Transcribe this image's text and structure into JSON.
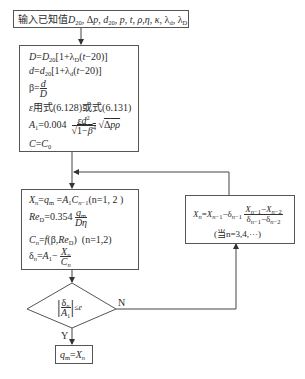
{
  "diagram": {
    "type": "flowchart",
    "input_box": {
      "prefix": "输入已知值",
      "variables": [
        "D20",
        "Δp",
        "d20",
        "p",
        "t",
        "ρ",
        "η",
        "κ",
        "λd",
        "λD"
      ]
    },
    "init_box": {
      "lines": [
        {
          "text": "D=D20[1+λD(t−20)]"
        },
        {
          "text": "d=d20[1+λd(t−20)]"
        },
        {
          "text": "β=d/D"
        },
        {
          "text": "ε用式(6.128)或式(6.131)"
        },
        {
          "text": "A1=0.004 εd²/√(1−β⁴) √(Δpρ)"
        },
        {
          "text": "C=C0"
        }
      ],
      "eps_rule": "ε用式(6.128)或式(6.131)",
      "a1_coef": "0.004"
    },
    "iter_box": {
      "lines": [
        {
          "text": "Xn=qm=A1Cn−1(n=1,2)"
        },
        {
          "text": "ReD=0.354 qm/(Dη)"
        },
        {
          "text": "Cn=f(β,ReD) (n=1,2)"
        },
        {
          "text": "δn=A1−Xn/Cn"
        }
      ],
      "n_range": "(n=1, 2 )",
      "n_range2": "(n=1,2)",
      "re_coef": "0.354"
    },
    "decision": {
      "condition": "|δn/A1| ≤ e",
      "le": "≤e",
      "yes_label": "Y",
      "no_label": "N"
    },
    "result_box": {
      "text": "qm=Xn"
    },
    "update_box": {
      "formula": "Xn=Xn−1−δn−1 (Xn−1−Xn−2)/(δn−1−δn−2)",
      "condition": "(当n=3,4,···)"
    }
  },
  "labels": {
    "input_prefix": "输入已知值",
    "eps_rule_text": "用式(6.128)或式(6.131)",
    "a1_coef": "=0.004",
    "re_coef": "=0.354",
    "n12_a": "(n=1, 2 )",
    "n12_b": "(n=1,2)",
    "update_cond": "(当n=3,4,···)",
    "yes": "Y",
    "no": "N"
  }
}
